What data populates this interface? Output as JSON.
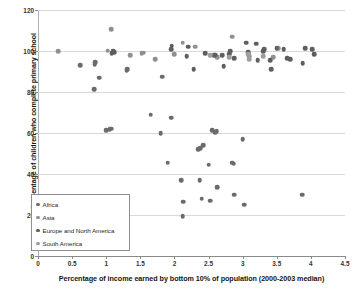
{
  "chart_data": {
    "type": "scatter",
    "title": "",
    "xlabel": "Percentage of income earned by bottom 10% of population (2000-2003 median)",
    "ylabel": "Percentage of children who complete primary school",
    "xlim": [
      0,
      4.5
    ],
    "ylim": [
      0,
      120
    ],
    "xticks": [
      "0",
      "0.5",
      "1",
      "1.5",
      "2",
      "2.5",
      "3",
      "3.5",
      "4",
      "4.5"
    ],
    "xtick_values": [
      0,
      0.5,
      1,
      1.5,
      2,
      2.5,
      3,
      3.5,
      4,
      4.5
    ],
    "yticks": [
      "0",
      "20",
      "40",
      "60",
      "80",
      "100",
      "120"
    ],
    "ytick_values": [
      0,
      20,
      40,
      60,
      80,
      100,
      120
    ],
    "grid": "horizontal",
    "legend_position": "lower-left-inside",
    "marker_color": "#6b6b6b",
    "series": [
      {
        "name": "Africa",
        "color": "#6b6b6b",
        "points": [
          [
            0.62,
            93.0
          ],
          [
            0.82,
            81.5
          ],
          [
            0.83,
            93.5
          ],
          [
            0.84,
            94.5
          ],
          [
            0.9,
            87.0
          ],
          [
            1.0,
            61.5
          ],
          [
            1.05,
            61.8
          ],
          [
            1.07,
            62.0
          ],
          [
            1.3,
            90.5
          ],
          [
            1.31,
            91.0
          ],
          [
            1.65,
            69.0
          ],
          [
            1.8,
            60.0
          ],
          [
            1.82,
            87.5
          ],
          [
            1.9,
            45.5
          ],
          [
            1.95,
            67.5
          ],
          [
            2.1,
            37.0
          ],
          [
            2.12,
            19.5
          ],
          [
            2.13,
            26.5
          ],
          [
            2.35,
            52.0
          ],
          [
            2.37,
            37.0
          ],
          [
            2.38,
            52.5
          ],
          [
            2.4,
            28.0
          ],
          [
            2.42,
            54.0
          ],
          [
            2.5,
            44.5
          ],
          [
            2.52,
            27.0
          ],
          [
            2.55,
            61.5
          ],
          [
            2.6,
            60.5
          ],
          [
            2.62,
            61.0
          ],
          [
            2.63,
            33.5
          ],
          [
            2.85,
            45.5
          ],
          [
            2.87,
            45.0
          ],
          [
            2.88,
            30.0
          ],
          [
            3.0,
            57.0
          ],
          [
            3.02,
            25.0
          ],
          [
            3.87,
            30.0
          ]
        ]
      },
      {
        "name": "Asia",
        "color": "#8f8f8f",
        "points": [
          [
            0.3,
            100.0
          ],
          [
            1.02,
            100.2
          ],
          [
            1.07,
            110.5
          ],
          [
            1.35,
            98.0
          ],
          [
            1.52,
            99.0
          ],
          [
            1.55,
            99.2
          ],
          [
            1.72,
            96.0
          ],
          [
            2.0,
            98.5
          ],
          [
            2.12,
            104.0
          ],
          [
            2.3,
            102.0
          ],
          [
            2.85,
            107.0
          ],
          [
            2.63,
            97.0
          ],
          [
            3.1,
            97.5
          ],
          [
            3.45,
            97.0
          ],
          [
            3.52,
            101.5
          ]
        ]
      },
      {
        "name": "Europe and North America",
        "color": "#5e5e5e",
        "points": [
          [
            1.08,
            99.0
          ],
          [
            1.1,
            100.0
          ],
          [
            1.12,
            99.5
          ],
          [
            1.95,
            101.0
          ],
          [
            1.96,
            102.5
          ],
          [
            2.18,
            97.5
          ],
          [
            2.2,
            102.0
          ],
          [
            2.28,
            91.0
          ],
          [
            2.45,
            99.0
          ],
          [
            2.58,
            98.0
          ],
          [
            2.6,
            98.2
          ],
          [
            2.7,
            98.0
          ],
          [
            2.72,
            92.5
          ],
          [
            2.8,
            98.5
          ],
          [
            2.82,
            100.0
          ],
          [
            2.88,
            96.5
          ],
          [
            3.05,
            104.0
          ],
          [
            3.08,
            99.5
          ],
          [
            3.2,
            103.5
          ],
          [
            3.22,
            95.5
          ],
          [
            3.3,
            100.0
          ],
          [
            3.32,
            101.0
          ],
          [
            3.4,
            95.5
          ],
          [
            3.42,
            91.0
          ],
          [
            3.5,
            101.5
          ],
          [
            3.6,
            101.0
          ],
          [
            3.65,
            96.5
          ],
          [
            3.7,
            96.0
          ],
          [
            3.88,
            94.0
          ],
          [
            3.92,
            101.5
          ],
          [
            4.02,
            101.0
          ],
          [
            4.05,
            98.5
          ]
        ]
      },
      {
        "name": "South America",
        "color": "#9e9e9e",
        "points": [
          [
            2.8,
            97.0
          ],
          [
            3.08,
            98.5
          ],
          [
            3.1,
            96.0
          ],
          [
            3.3,
            97.5
          ],
          [
            2.52,
            98.0
          ]
        ]
      }
    ]
  },
  "legend": {
    "items": [
      {
        "label": "Africa",
        "color": "#6b6b6b"
      },
      {
        "label": "Asia",
        "color": "#8f8f8f"
      },
      {
        "label": "Europe and North America",
        "color": "#5e5e5e"
      },
      {
        "label": "South America",
        "color": "#9e9e9e"
      }
    ]
  }
}
